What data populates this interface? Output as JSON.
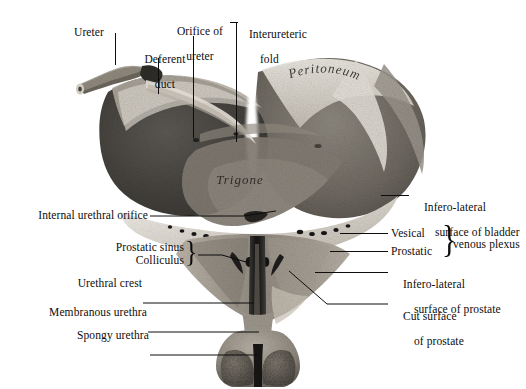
{
  "figure": {
    "background_color": "#ffffff",
    "ink_color": "#0d0d0d"
  },
  "in_situ_labels": [
    {
      "name": "peritoneum",
      "text": "Peritoneum"
    },
    {
      "name": "trigone",
      "text": "Trigone"
    }
  ],
  "labels": {
    "ureter": "Ureter",
    "deferent_duct_l1": "Deferent",
    "deferent_duct_l2": "duct",
    "orifice_of_ureter_l1": "Orifice of",
    "orifice_of_ureter_l2": "ureter",
    "interureteric_fold_l1": "Interureteric",
    "interureteric_fold_l2": "fold",
    "infero_lateral_bladder_l1": "Infero-lateral",
    "infero_lateral_bladder_l2": "surface of bladder",
    "vesical": "Vesical",
    "prostatic": "Prostatic",
    "venous_plexus": "venous plexus",
    "infero_lateral_prostate_l1": "Infero-lateral",
    "infero_lateral_prostate_l2": "surface of prostate",
    "cut_surface_prostate_l1": "Cut surface",
    "cut_surface_prostate_l2": "of prostate",
    "internal_urethral_orifice": "Internal urethral orifice",
    "prostatic_sinus": "Prostatic sinus",
    "colliculus": "Colliculus",
    "urethral_crest": "Urethral crest",
    "membranous_urethra": "Membranous urethra",
    "spongy_urethra": "Spongy urethra"
  },
  "braces": {
    "left_brace_glyph": "}",
    "right_brace_glyph": "}"
  },
  "palette": {
    "mucosa_dark": "#4a4845",
    "mucosa_mid": "#6f6a63",
    "wall_light": "#cfc9bf",
    "peritoneum_pale": "#e8e4dc",
    "rim_white": "#f3f0ea",
    "shadow": "#2b2a28",
    "spongy_speckle": "#5d5a55"
  }
}
